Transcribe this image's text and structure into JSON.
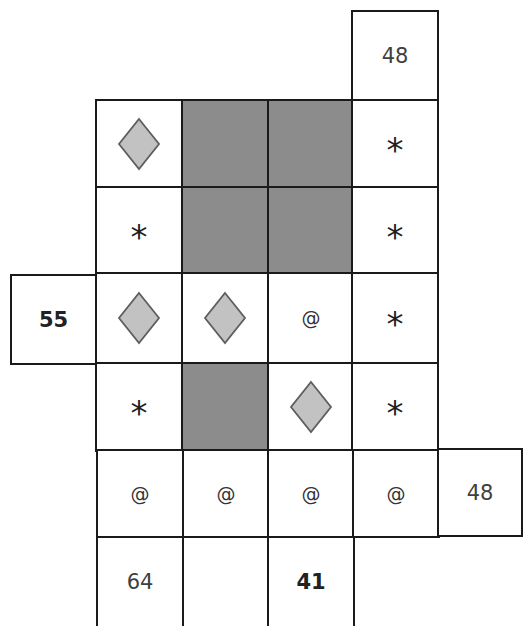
{
  "puzzle": {
    "type": "grid-symbol-sum-puzzle",
    "colors": {
      "grid_line": "#1a1a1a",
      "shaded_cell": "#8c8c8c",
      "diamond_fill": "#c2c2c2",
      "diamond_stroke": "#5e5e5e",
      "background": "#ffffff"
    },
    "column_x": [
      96,
      182,
      268,
      353,
      438
    ],
    "row_y": [
      100,
      187,
      273,
      362,
      449,
      537
    ],
    "cell_size": 87,
    "grid": [
      [
        "diamond",
        "shaded",
        "shaded",
        "star"
      ],
      [
        "star",
        "shaded",
        "shaded",
        "star"
      ],
      [
        "diamond",
        "diamond",
        "at",
        "star"
      ],
      [
        "star",
        "shaded",
        "diamond",
        "star"
      ],
      [
        "at",
        "at",
        "at",
        "at"
      ]
    ],
    "symbols": {
      "star": "*",
      "at": "@",
      "diamond": "diamond",
      "shaded": ""
    },
    "clues": {
      "top_col4": {
        "value": "48",
        "bold": false
      },
      "left_row3": {
        "value": "55",
        "bold": true
      },
      "right_row5": {
        "value": "48",
        "bold": false
      },
      "bottom_col1": {
        "value": "64",
        "bold": false
      },
      "bottom_col2": {
        "value": "",
        "bold": false
      },
      "bottom_col3": {
        "value": "41",
        "bold": true
      }
    }
  }
}
